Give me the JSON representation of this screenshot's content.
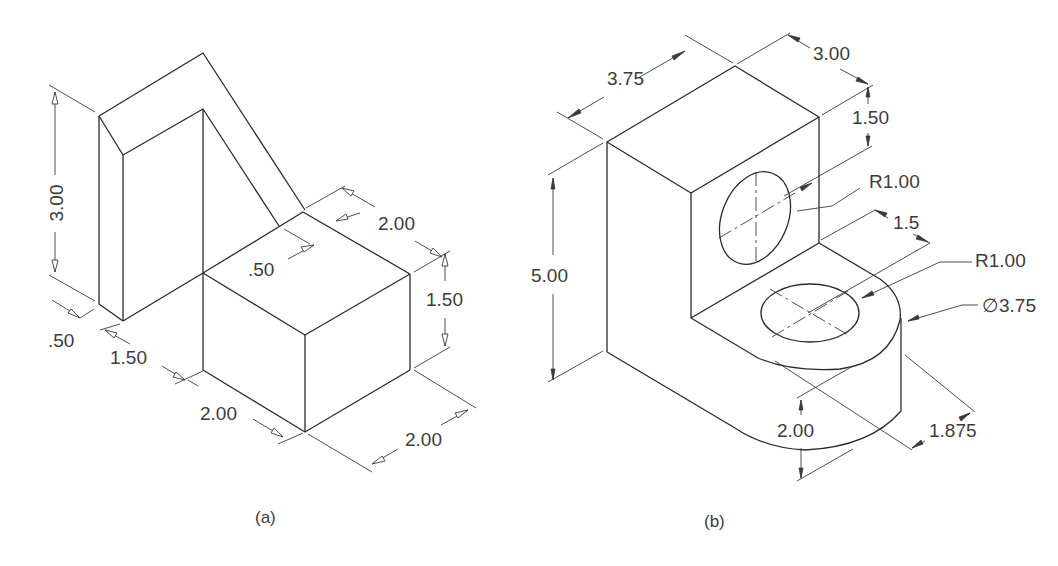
{
  "figure_a": {
    "caption": "(a)",
    "dimensions": {
      "height_total": "3.00",
      "thickness_left": ".50",
      "offset_depth": "1.50",
      "block_width": "2.00",
      "top_offset": ".50",
      "top_depth": "2.00",
      "block_height": "1.50",
      "block_depth": "2.00"
    }
  },
  "figure_b": {
    "caption": "(b)",
    "dimensions": {
      "width": "3.75",
      "depth": "3.00",
      "hole_offset": "1.50",
      "upper_hole_radius": "R1.00",
      "base_offset": "1.5",
      "lower_hole_radius": "R1.00",
      "boss_diameter": "∅3.75",
      "height": "5.00",
      "base_height": "2.00",
      "boss_offset": "1.875"
    }
  },
  "colors": {
    "line": "#2a2a2a",
    "text": "#3c3c3c",
    "background": "#ffffff"
  }
}
